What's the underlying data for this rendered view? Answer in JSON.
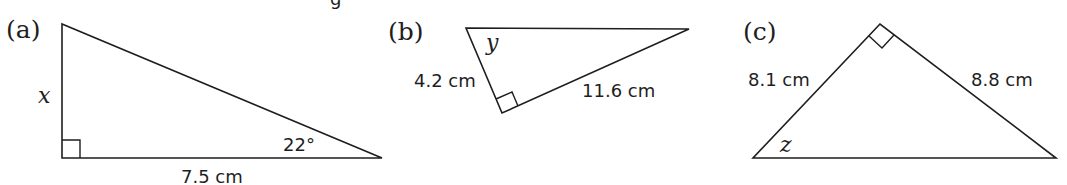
{
  "figure": {
    "header_fragment": "g",
    "panels": [
      {
        "id": "a",
        "label": "(a)",
        "vertices": [
          [
            62,
            24
          ],
          [
            62,
            158
          ],
          [
            382,
            158
          ]
        ],
        "right_angle_at": "bottom-left",
        "labels": {
          "unknown_side": "x",
          "base": "7.5 cm",
          "angle": "22°"
        }
      },
      {
        "id": "b",
        "label": "(b)",
        "vertices": [
          [
            466,
            28
          ],
          [
            689,
            29
          ],
          [
            502,
            113
          ]
        ],
        "right_angle_at": "bottom",
        "labels": {
          "unknown_angle": "y",
          "short_side": "4.2 cm",
          "long_side": "11.6 cm"
        }
      },
      {
        "id": "c",
        "label": "(c)",
        "vertices": [
          [
            880,
            24
          ],
          [
            753,
            158
          ],
          [
            1056,
            158
          ]
        ],
        "right_angle_at": "apex",
        "labels": {
          "left_side": "8.1 cm",
          "right_side": "8.8 cm",
          "unknown_angle": "z"
        }
      }
    ]
  }
}
